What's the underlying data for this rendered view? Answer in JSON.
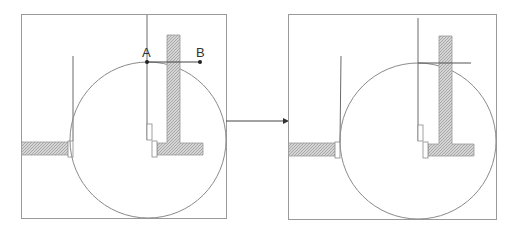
{
  "diagram": {
    "type": "geometric-construction",
    "left_panel": {
      "frame": {
        "x": 21,
        "y": 14,
        "w": 205,
        "h": 204
      },
      "circle": {
        "cx": 148,
        "cy": 140,
        "r": 78
      },
      "points": [
        {
          "label": "A",
          "x": 147,
          "y": 62
        },
        {
          "label": "B",
          "x": 200,
          "y": 62
        }
      ],
      "segment_AB": {
        "x1": 147,
        "y1": 62,
        "x2": 200,
        "y2": 62
      }
    },
    "right_panel": {
      "frame": {
        "x": 288,
        "y": 14,
        "w": 208,
        "h": 205
      },
      "circle": {
        "cx": 418,
        "cy": 141,
        "r": 78
      },
      "tangent_line": {
        "x1": 418,
        "y1": 63,
        "x2": 471,
        "y2": 63
      }
    },
    "transition_arrow": {
      "x1": 226,
      "y1": 121,
      "x2": 288,
      "y2": 121
    },
    "colors": {
      "frame": "#9a9a9a",
      "hatch": "#b8b8b8",
      "line": "#6a6a6a",
      "point": "#222222"
    }
  }
}
